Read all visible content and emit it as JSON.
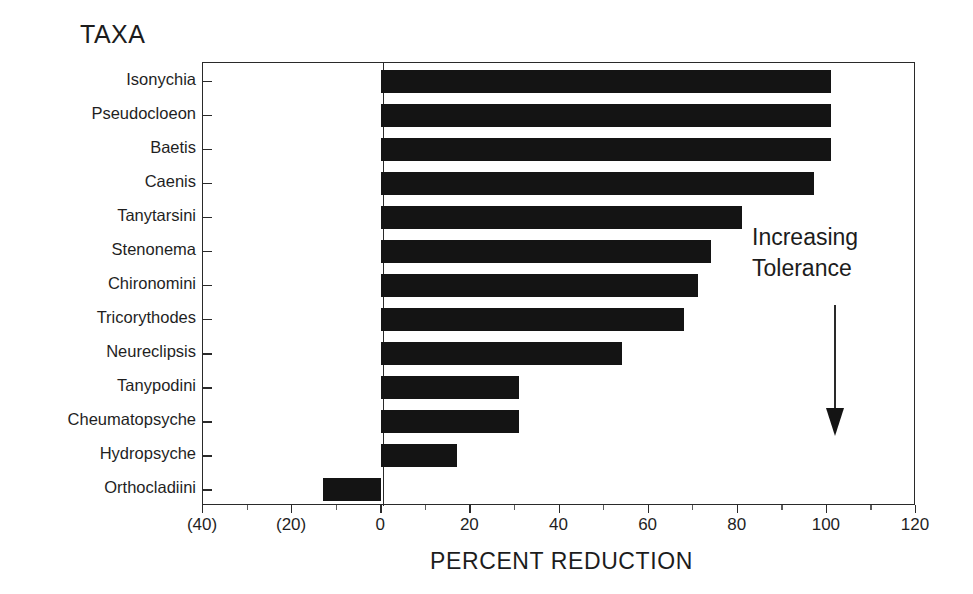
{
  "figure": {
    "taxa_heading": "TAXA",
    "xaxis_title": "PERCENT REDUCTION",
    "annotation_line1": "Increasing",
    "annotation_line2": "Tolerance",
    "arrow_icon": "down-arrow-icon",
    "bar_color": "#141414",
    "axis_color": "#2a2a2a"
  },
  "chart_data": {
    "type": "bar",
    "orientation": "horizontal",
    "title": "",
    "xlabel": "PERCENT REDUCTION",
    "ylabel": "TAXA",
    "xlim": [
      -40,
      120
    ],
    "ylim": [
      0,
      13
    ],
    "grid": false,
    "legend": null,
    "xticks": [
      -40,
      -20,
      0,
      20,
      40,
      60,
      80,
      100,
      120
    ],
    "xtick_labels": [
      "(40)",
      "(20)",
      "0",
      "20",
      "40",
      "60",
      "80",
      "100",
      "120"
    ],
    "minor_xticks": [
      -30,
      -10,
      10,
      30,
      50,
      70,
      90,
      110
    ],
    "categories": [
      "Isonychia",
      "Pseudocloeon",
      "Baetis",
      "Caenis",
      "Tanytarsini",
      "Stenonema",
      "Chironomini",
      "Tricorythodes",
      "Neureclipsis",
      "Tanypodini",
      "Cheumatopsyche",
      "Hydropsyche",
      "Orthocladiini"
    ],
    "values": [
      101,
      101,
      101,
      97,
      81,
      74,
      71,
      68,
      54,
      31,
      31,
      17,
      -13
    ],
    "annotations": [
      {
        "text": "Increasing Tolerance",
        "arrow": "down"
      }
    ]
  }
}
